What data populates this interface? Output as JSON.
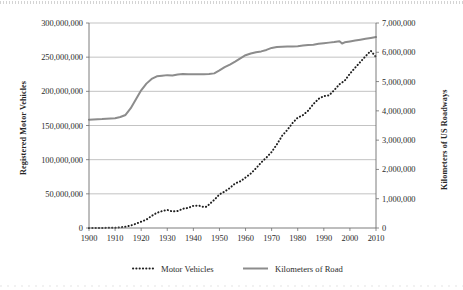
{
  "chart_data": {
    "type": "line",
    "title": "",
    "xlabel": "",
    "ylabel": "Registered Motor Vehicles",
    "y2label": "Kilometers of US Roadways",
    "grid": true,
    "legend_position": "bottom",
    "xlim": [
      1900,
      2010
    ],
    "ylim": [
      0,
      300000000
    ],
    "y2lim": [
      0,
      7000000
    ],
    "xticks": [
      1900,
      1910,
      1920,
      1930,
      1940,
      1950,
      1960,
      1970,
      1980,
      1990,
      2000,
      2010
    ],
    "xtick_labels": [
      "1900",
      "1910",
      "1920",
      "1930",
      "1940",
      "1950",
      "1960",
      "1970",
      "1980",
      "1990",
      "2000",
      "2010"
    ],
    "yticks": [
      0,
      50000000,
      100000000,
      150000000,
      200000000,
      250000000,
      300000000
    ],
    "ytick_labels": [
      "0",
      "50,000,000",
      "100,000,000",
      "150,000,000",
      "200,000,000",
      "250,000,000",
      "300,000,000"
    ],
    "y2ticks": [
      0,
      1000000,
      2000000,
      3000000,
      4000000,
      5000000,
      6000000,
      7000000
    ],
    "y2tick_labels": [
      "0",
      "1,000,000",
      "2,000,000",
      "3,000,000",
      "4,000,000",
      "5,000,000",
      "6,000,000",
      "7,000,000"
    ],
    "series": [
      {
        "name": "Motor Vehicles",
        "legend_label": "Motor Vehicles",
        "axis": "left",
        "style": "dotted",
        "color": "#1f1f1f",
        "x": [
          1900,
          1905,
          1910,
          1912,
          1914,
          1916,
          1918,
          1920,
          1922,
          1924,
          1926,
          1928,
          1930,
          1932,
          1934,
          1936,
          1938,
          1940,
          1942,
          1944,
          1945,
          1946,
          1948,
          1950,
          1952,
          1954,
          1956,
          1958,
          1960,
          1962,
          1964,
          1966,
          1968,
          1970,
          1972,
          1974,
          1976,
          1978,
          1980,
          1982,
          1984,
          1986,
          1988,
          1990,
          1992,
          1994,
          1996,
          1998,
          2000,
          2002,
          2004,
          2006,
          2008,
          2010
        ],
        "y": [
          8000,
          78000,
          468000,
          1000000,
          1800000,
          3600000,
          6200000,
          9200000,
          12300000,
          17600000,
          22200000,
          24700000,
          26500000,
          24100000,
          24900000,
          28200000,
          29400000,
          32400000,
          32900000,
          30700000,
          31000000,
          34400000,
          41100000,
          49200000,
          53300000,
          58600000,
          65200000,
          68300000,
          73900000,
          79700000,
          87300000,
          95900000,
          103100000,
          111200000,
          122300000,
          134900000,
          143500000,
          153600000,
          161500000,
          165100000,
          171800000,
          181400000,
          189000000,
          193100000,
          194100000,
          201800000,
          210400000,
          215500000,
          225800000,
          234600000,
          243000000,
          251400000,
          259400000,
          250200000
        ]
      },
      {
        "name": "Kilometers of Road",
        "legend_label": "Kilometers of Road",
        "axis": "right",
        "style": "solid",
        "color": "#8c8c8c",
        "x": [
          1900,
          1905,
          1910,
          1912,
          1914,
          1916,
          1918,
          1920,
          1922,
          1924,
          1926,
          1928,
          1930,
          1932,
          1934,
          1936,
          1938,
          1940,
          1942,
          1944,
          1946,
          1948,
          1950,
          1952,
          1954,
          1956,
          1958,
          1960,
          1962,
          1964,
          1966,
          1968,
          1970,
          1972,
          1974,
          1976,
          1978,
          1980,
          1982,
          1984,
          1986,
          1988,
          1990,
          1992,
          1994,
          1996,
          1997,
          1998,
          2000,
          2002,
          2004,
          2006,
          2008,
          2010
        ],
        "y": [
          3700000,
          3720000,
          3750000,
          3790000,
          3860000,
          4090000,
          4400000,
          4700000,
          4930000,
          5090000,
          5180000,
          5200000,
          5220000,
          5210000,
          5240000,
          5260000,
          5250000,
          5250000,
          5250000,
          5250000,
          5260000,
          5280000,
          5380000,
          5490000,
          5580000,
          5680000,
          5790000,
          5900000,
          5960000,
          6000000,
          6030000,
          6080000,
          6150000,
          6180000,
          6190000,
          6200000,
          6200000,
          6210000,
          6230000,
          6250000,
          6260000,
          6290000,
          6310000,
          6330000,
          6350000,
          6380000,
          6300000,
          6340000,
          6370000,
          6400000,
          6430000,
          6460000,
          6490000,
          6520000
        ]
      }
    ]
  },
  "axes": {
    "left_title": "Registered Motor Vehicles",
    "right_title": "Kilometers of US Roadways"
  },
  "legend": {
    "items": [
      {
        "label": "Motor Vehicles",
        "marker": "dotted-line-marker"
      },
      {
        "label": "Kilometers of Road",
        "marker": "solid-line-marker"
      }
    ]
  },
  "colors": {
    "vehicles_line": "#1f1f1f",
    "road_line": "#8c8c8c",
    "gridline": "#9a9a9a",
    "frame": "#6e6e6e",
    "background": "#ffffff"
  }
}
